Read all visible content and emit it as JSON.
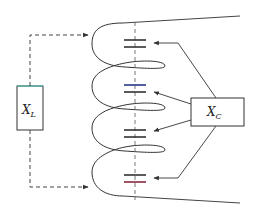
{
  "diagram": {
    "type": "helical-resonator-equivalent-circuit",
    "inductor_box": {
      "label": "X",
      "subscript": "L"
    },
    "capacitor_box": {
      "label": "X",
      "subscript": "C"
    },
    "capacitor_count": 4,
    "coil_turns": 4,
    "colors": {
      "line": "#333333",
      "dashed": "#444444",
      "box_top_accent": "#3bbfb0",
      "capacitor_accent_blue": "#2a3a8a",
      "capacitor_accent_red": "#8a2a3a"
    }
  }
}
